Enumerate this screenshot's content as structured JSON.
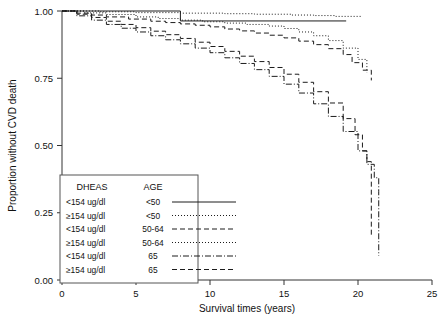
{
  "chart_data": {
    "type": "line",
    "title": "",
    "xlabel": "Survival times (years)",
    "ylabel": "Proportion without CVD death",
    "xlim": [
      0,
      25
    ],
    "ylim": [
      0,
      1.0
    ],
    "xticks": [
      0,
      5,
      10,
      15,
      20,
      25
    ],
    "xticklabels": [
      "0",
      "5",
      "10",
      "15",
      "20",
      "25"
    ],
    "yticks": [
      0.0,
      0.25,
      0.5,
      0.75,
      1.0
    ],
    "yticklabels": [
      "0.00",
      "0.25",
      "0.50",
      "0.75",
      "1.00"
    ],
    "grid": false,
    "legend_position": "lower-left",
    "legend_headers": [
      "DHEAS",
      "AGE"
    ],
    "series": [
      {
        "name": "<154 ug/dl, <50",
        "dheas": "<154 ug/dl",
        "age": "<50",
        "dash": "none",
        "x": [
          0,
          8.0,
          8.0,
          19.2
        ],
        "y": [
          1.0,
          1.0,
          0.963,
          0.963
        ]
      },
      {
        "name": "≥154 ug/dl, <50",
        "dheas": "≥154 ug/dl",
        "age": "<50",
        "dash": "1,2",
        "x": [
          0,
          2.5,
          5.0,
          8.0,
          11.0,
          13.0,
          15.5,
          17.0,
          18.5,
          20.2
        ],
        "y": [
          1.0,
          0.997,
          0.994,
          0.992,
          0.99,
          0.988,
          0.985,
          0.983,
          0.98,
          0.978
        ]
      },
      {
        "name": "<154 ug/dl, 50-64",
        "dheas": "<154 ug/dl",
        "age": "50-64",
        "dash": "5,3",
        "x": [
          0,
          1.0,
          2.0,
          3.0,
          4.5,
          6.0,
          7.0,
          8.0,
          9.0,
          10.0,
          11.0,
          12.0,
          13.0,
          14.0,
          15.0,
          16.0,
          17.0,
          18.0,
          19.0,
          19.6,
          20.3,
          20.9
        ],
        "y": [
          1.0,
          0.992,
          0.985,
          0.978,
          0.97,
          0.962,
          0.957,
          0.952,
          0.947,
          0.941,
          0.933,
          0.926,
          0.918,
          0.91,
          0.9,
          0.888,
          0.875,
          0.86,
          0.838,
          0.808,
          0.78,
          0.742
        ]
      },
      {
        "name": "≥154 ug/dl, 50-64",
        "dheas": "≥154 ug/dl",
        "age": "50-64",
        "dash": "1,2",
        "x": [
          0,
          1.5,
          3.0,
          5.0,
          6.5,
          8.0,
          9.5,
          11.0,
          12.5,
          14.0,
          15.0,
          16.0,
          17.0,
          18.0,
          19.0,
          20.0,
          20.6
        ],
        "y": [
          1.0,
          0.993,
          0.987,
          0.978,
          0.972,
          0.966,
          0.96,
          0.955,
          0.95,
          0.944,
          0.935,
          0.922,
          0.908,
          0.89,
          0.862,
          0.82,
          0.772
        ]
      },
      {
        "name": "<154 ug/dl, 65",
        "dheas": "<154 ug/dl",
        "age": "65",
        "dash": "6,2,1,2",
        "x": [
          0,
          1.0,
          2.0,
          3.0,
          4.0,
          5.0,
          6.0,
          7.0,
          8.0,
          9.0,
          10.0,
          11.0,
          12.0,
          13.0,
          14.0,
          15.0,
          16.0,
          17.0,
          18.0,
          19.0,
          20.0,
          20.6,
          21.1,
          21.4,
          21.4
        ],
        "y": [
          1.0,
          0.982,
          0.966,
          0.95,
          0.936,
          0.922,
          0.908,
          0.893,
          0.878,
          0.862,
          0.845,
          0.826,
          0.805,
          0.782,
          0.757,
          0.728,
          0.695,
          0.655,
          0.608,
          0.552,
          0.48,
          0.43,
          0.38,
          0.33,
          0.09
        ]
      },
      {
        "name": "≥154 ug/dl, 65",
        "dheas": "≥154 ug/dl",
        "age": "65",
        "dash": "5,3",
        "x": [
          0,
          1.0,
          2.0,
          3.0,
          4.0,
          5.0,
          6.0,
          7.0,
          8.0,
          9.0,
          10.0,
          11.0,
          12.0,
          13.0,
          14.0,
          15.0,
          16.0,
          17.0,
          18.0,
          19.0,
          19.8,
          20.3,
          20.6,
          20.9,
          20.9
        ],
        "y": [
          1.0,
          0.988,
          0.976,
          0.962,
          0.95,
          0.938,
          0.925,
          0.912,
          0.898,
          0.884,
          0.868,
          0.85,
          0.832,
          0.812,
          0.79,
          0.765,
          0.735,
          0.7,
          0.658,
          0.6,
          0.54,
          0.48,
          0.44,
          0.4,
          0.16
        ]
      }
    ]
  },
  "legend": {
    "rows": [
      {
        "dheas": "<154 ug/dl",
        "age": "<50"
      },
      {
        "dheas": "≥154 ug/dl",
        "age": "<50"
      },
      {
        "dheas": "<154 ug/dl",
        "age": "50-64"
      },
      {
        "dheas": "≥154 ug/dl",
        "age": "50-64"
      },
      {
        "dheas": "<154 ug/dl",
        "age": "65"
      },
      {
        "dheas": "≥154 ug/dl",
        "age": "65"
      }
    ]
  }
}
